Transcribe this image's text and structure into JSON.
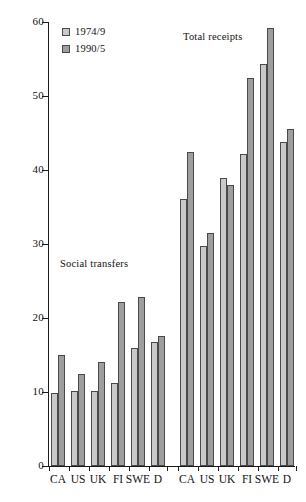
{
  "chart_data": {
    "type": "bar",
    "title": "",
    "xlabel": "",
    "ylabel": "% GDP",
    "ylim": [
      0,
      60
    ],
    "yticks": [
      0,
      10,
      20,
      30,
      40,
      50,
      60
    ],
    "grid": false,
    "legend_position": "top-left",
    "legend": [
      "1974/9",
      "1990/5"
    ],
    "annotations": [
      {
        "text": "Social transfers",
        "group": "left"
      },
      {
        "text": "Total receipts",
        "group": "right"
      }
    ],
    "groups": [
      {
        "name": "Social transfers",
        "categories": [
          "CA",
          "US",
          "UK",
          "FI",
          "SWE",
          "D"
        ],
        "series": [
          {
            "name": "1974/9",
            "values": [
              9.8,
              10.2,
              10.2,
              11.2,
              16.0,
              16.7
            ]
          },
          {
            "name": "1990/5",
            "values": [
              15.0,
              12.4,
              14.0,
              22.1,
              22.8,
              17.6
            ]
          }
        ]
      },
      {
        "name": "Total receipts",
        "categories": [
          "CA",
          "US",
          "UK",
          "FI",
          "SWE",
          "D"
        ],
        "series": [
          {
            "name": "1974/9",
            "values": [
              36.1,
              29.7,
              38.9,
              42.2,
              54.3,
              43.8
            ]
          },
          {
            "name": "1990/5",
            "values": [
              42.5,
              31.5,
              38.0,
              52.4,
              59.2,
              45.6
            ]
          }
        ]
      }
    ]
  },
  "ylabels": [
    "0",
    "10",
    "20",
    "30",
    "40",
    "50",
    "60"
  ],
  "legend": {
    "series1_label": "1974/9",
    "series2_label": "1990/5"
  },
  "annotations": {
    "social": "Social transfers",
    "total": "Total receipts"
  },
  "axis": {
    "y_title": "% GDP"
  },
  "colors": {
    "series1": "#c9c9c9",
    "series2": "#9e9e9e",
    "axis": "#1a1a1a",
    "bar_border": "#4a4a4a"
  }
}
